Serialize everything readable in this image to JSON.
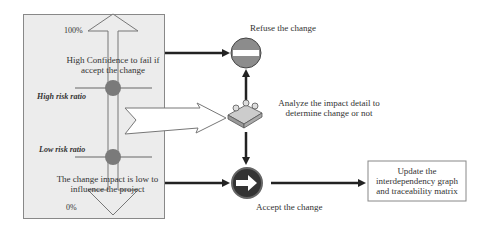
{
  "scale": {
    "top_label": "100%",
    "bottom_label": "0%",
    "high_risk_label": "High risk ratio",
    "low_risk_label": "Low risk ratio",
    "high_text": "High Confidence to fail if accept the change",
    "low_text": "The change impact is low to influence the project"
  },
  "nodes": {
    "refuse": {
      "label": "Refuse the change",
      "icon": "no-entry-sign"
    },
    "analyze": {
      "label": "Analyze the impact detail to determine change or not",
      "icon": "people-meeting"
    },
    "accept": {
      "label": "Accept the change",
      "icon": "right-arrow-sign"
    },
    "update": {
      "label": "Update the interdependency graph and traceability matrix"
    }
  },
  "colors": {
    "panel_bg": "#ececec",
    "marker": "#8a8a8a",
    "refuse_sign": "#8c8c8c",
    "accept_sign": "#333333",
    "arrow": "#222222"
  }
}
